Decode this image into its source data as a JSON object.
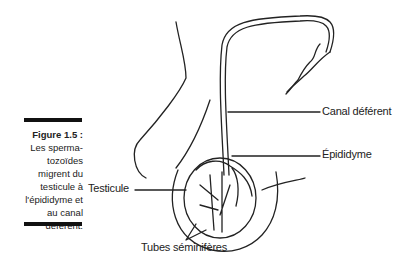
{
  "figure": {
    "number": "Figure 1.5 :",
    "caption_lines": [
      "Les sperma-",
      "tozoïdes",
      "migrent du",
      "testicule à",
      "l'épididyme et",
      "au canal",
      "déférent."
    ]
  },
  "labels": {
    "canal_deferent": "Canal déférent",
    "epididyme": "Épididyme",
    "testicule": "Testicule",
    "tubes_seminiferes": "Tubes séminifères"
  }
}
